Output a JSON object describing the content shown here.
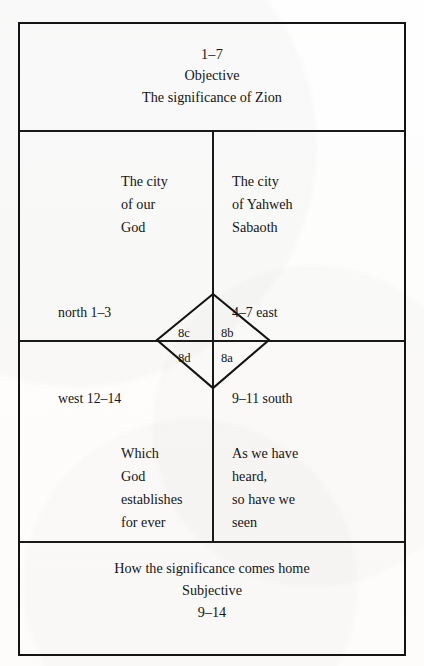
{
  "diagram": {
    "type": "chiastic-structure-table",
    "header": {
      "verses": "1–7",
      "mode": "Objective",
      "description": "The significance of Zion"
    },
    "footer": {
      "description": "How the significance comes home",
      "mode": "Subjective",
      "verses": "9–14"
    },
    "quadrants": {
      "top_left": {
        "lines": [
          "The city",
          "of our",
          "God"
        ]
      },
      "top_right": {
        "lines": [
          "The city",
          "of Yahweh",
          "Sabaoth"
        ]
      },
      "bottom_left": {
        "lines": [
          "Which",
          "God",
          "establishes",
          "for ever"
        ]
      },
      "bottom_right": {
        "lines": [
          "As we have",
          "heard,",
          "so have we",
          "seen"
        ]
      }
    },
    "directions": {
      "north": "north 1–3",
      "east": "4–7 east",
      "west": "west 12–14",
      "south": "9–11 south"
    },
    "diamond": {
      "top_left": "8c",
      "top_right": "8b",
      "bottom_left": "8d",
      "bottom_right": "8a"
    },
    "colors": {
      "ink": "#151515",
      "rule": "#1a1a1a",
      "paper": "#fdfdfc"
    }
  }
}
